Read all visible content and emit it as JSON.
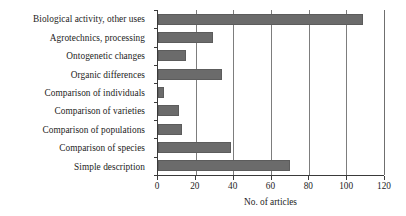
{
  "chart_data": {
    "type": "bar",
    "orientation": "horizontal",
    "title": "",
    "xlabel": "No. of articles",
    "ylabel": "",
    "xlim": [
      0,
      120
    ],
    "xticks": [
      0,
      20,
      40,
      60,
      80,
      100,
      120
    ],
    "grid": "vertical gridlines at each x tick",
    "legend": "none",
    "bar_color": "#6b6b6b",
    "categories": [
      "Biological activity, other uses",
      "Agrotechnics, processing",
      "Ontogenetic changes",
      "Organic differences",
      "Comparison of individuals",
      "Comparison of varieties",
      "Comparison of populations",
      "Comparison of species",
      "Simple description"
    ],
    "values": [
      109,
      29,
      15,
      34,
      3,
      11,
      13,
      39,
      70
    ]
  }
}
